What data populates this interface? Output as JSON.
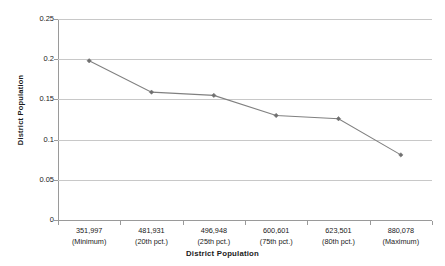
{
  "chart_data": {
    "type": "line",
    "title": "",
    "xlabel": "District Population",
    "ylabel": "District Population",
    "categories": [
      "351,997\n(Minimum)",
      "481,931\n(20th pct.)",
      "496,948\n(25th pct.)",
      "600,601\n(75th pct.)",
      "623,501\n(80th pct.)",
      "880,078\n(Maximum)"
    ],
    "category_values": [
      "351,997",
      "481,931",
      "496,948",
      "600,601",
      "623,501",
      "880,078"
    ],
    "category_qualifiers": [
      "(Minimum)",
      "(20th pct.)",
      "(25th pct.)",
      "(75th pct.)",
      "(80th pct.)",
      "(Maximum)"
    ],
    "values": [
      0.198,
      0.159,
      0.155,
      0.13,
      0.126,
      0.081
    ],
    "ylim": [
      0,
      0.25
    ],
    "yticks": [
      0,
      0.05,
      0.1,
      0.15,
      0.2,
      0.25
    ],
    "ytick_labels": [
      "0",
      "0.05",
      "0.1",
      "0.15",
      "0.2",
      "0.25"
    ],
    "grid": true,
    "legend": "none",
    "series_color": "#808080",
    "marker_color": "#707070",
    "gridline_color": "#c8c8c8",
    "axis_color": "#9a9a9a"
  },
  "axes": {
    "y_title": "District Population",
    "x_title": "District Population"
  }
}
